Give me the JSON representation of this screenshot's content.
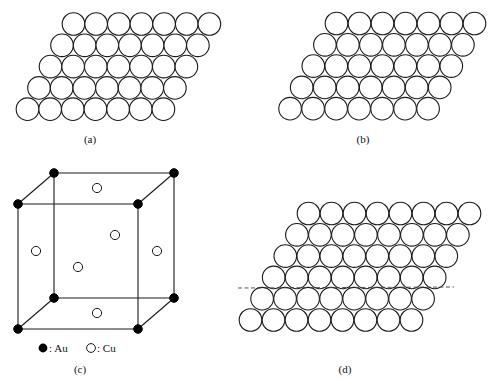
{
  "figure": {
    "stroke_color": "#1a1a1a",
    "fill_color": "#ffffff",
    "dot_color": "#000000"
  },
  "panels": {
    "a": {
      "caption": "(a)",
      "caption_pos": [
        90,
        143
      ],
      "layer": {
        "rows": 5,
        "cols": 7,
        "origin": [
          73.5,
          24
        ],
        "dx": 22.65,
        "dy": 21.3,
        "row_shift": -11.5,
        "r": 11.3
      }
    },
    "b": {
      "caption": "(b)",
      "caption_pos": [
        363,
        143
      ],
      "layer": {
        "rows": 5,
        "cols": 7,
        "origin": [
          336.5,
          23.5
        ],
        "dx": 23,
        "dy": 21.3,
        "row_shift": -11.6,
        "r": 11.3
      }
    },
    "c": {
      "caption": "(c)",
      "caption_pos": [
        80,
        373
      ],
      "cube": {
        "corners": {
          "back_top_left": [
            54,
            173
          ],
          "back_top_right": [
            174,
            173
          ],
          "front_top_left": [
            18,
            204
          ],
          "front_top_right": [
            138,
            204
          ],
          "back_bottom_left": [
            54,
            298
          ],
          "back_bottom_right": [
            174,
            298
          ],
          "front_bottom_left": [
            18,
            329
          ],
          "front_bottom_right": [
            138,
            329
          ]
        },
        "au_radius": 4.3,
        "cu_positions": [
          [
            97,
            188
          ],
          [
            115,
            235
          ],
          [
            36,
            251
          ],
          [
            157,
            251
          ],
          [
            78,
            267
          ],
          [
            97,
            313
          ]
        ],
        "cu_radius": 4.6
      },
      "legend": [
        {
          "symbol": "filled-circle",
          "label": ": Au",
          "pos": [
            43,
            348
          ]
        },
        {
          "symbol": "open-circle",
          "label": ": Cu",
          "pos": [
            91,
            348
          ]
        }
      ]
    },
    "d": {
      "caption": "(d)",
      "caption_pos": [
        345,
        373
      ],
      "layer": {
        "rows": 6,
        "cols": 8,
        "origin": [
          308.5,
          213.5
        ],
        "dx": 23,
        "dy": 21.3,
        "row_shift": -11.6,
        "r": 11.3
      },
      "dashed_line": {
        "x1": 238,
        "y1": 288,
        "x2": 454,
        "y2": 287
      }
    }
  }
}
